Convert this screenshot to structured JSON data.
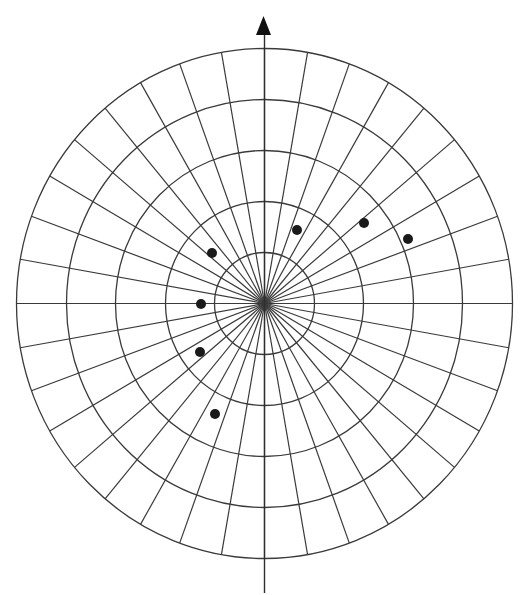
{
  "diagram": {
    "type": "polar-grid-plot",
    "center": {
      "x": 264.5,
      "y": 303.5
    },
    "rings": [
      {
        "rx": 50,
        "ry": 51
      },
      {
        "rx": 99,
        "ry": 102
      },
      {
        "rx": 149,
        "ry": 153
      },
      {
        "rx": 198,
        "ry": 204
      },
      {
        "rx": 248,
        "ry": 255
      }
    ],
    "spoke_count": 36,
    "spoke_interval_deg": 10,
    "vertical_axis": {
      "top_y": 30,
      "bottom_y": 593
    },
    "north_arrow": {
      "tip": {
        "x": 263.5,
        "y": 16
      },
      "base_y": 35,
      "half_width": 7.5,
      "color": "#111111"
    },
    "line_color": "#3a3a3a",
    "points": [
      {
        "x": 212,
        "y": 253
      },
      {
        "x": 297,
        "y": 230
      },
      {
        "x": 364,
        "y": 223
      },
      {
        "x": 408,
        "y": 239
      },
      {
        "x": 201,
        "y": 304
      },
      {
        "x": 200,
        "y": 352
      },
      {
        "x": 215,
        "y": 414
      }
    ],
    "point_radius": 5,
    "point_color": "#1a1a1a"
  }
}
